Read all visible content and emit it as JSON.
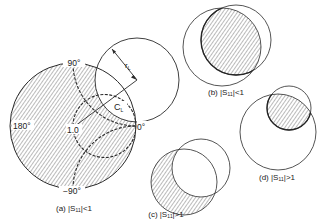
{
  "figure": {
    "panels": [
      {
        "id": "a",
        "caption": "(a) |S₁₁|<1",
        "labels": {
          "angle_90": "90°",
          "angle_180": "180°",
          "angle_0": "0°",
          "angle_minus90": "−90°",
          "center_value": "1.0",
          "stability_center": "C",
          "stability_center_sub": "L",
          "stability_radius": "r",
          "stability_radius_sub": "L"
        }
      },
      {
        "id": "b",
        "caption": "(b) |S₁₁|<1"
      },
      {
        "id": "c",
        "caption": "(c) |S₁₁|>1"
      },
      {
        "id": "d",
        "caption": "(d) |S₁₁|>1"
      }
    ]
  },
  "colors": {
    "line": "#2a2a2a",
    "hatch": "#555555",
    "background": "#ffffff"
  }
}
